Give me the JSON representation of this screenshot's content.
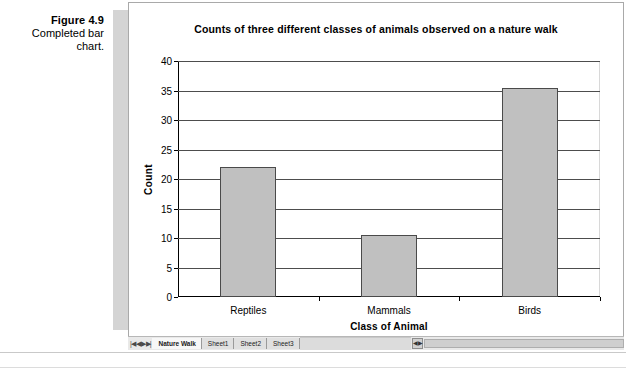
{
  "figure": {
    "number": "Figure 4.9",
    "description": "Completed bar chart."
  },
  "chart_data": {
    "type": "bar",
    "title": "Counts of three different classes of animals observed on a nature walk",
    "xlabel": "Class of Animal",
    "ylabel": "Count",
    "categories": [
      "Reptiles",
      "Mammals",
      "Birds"
    ],
    "values": [
      22,
      10.5,
      35.5
    ],
    "ylim": [
      0,
      40
    ],
    "ytick_labels": [
      "40",
      "35",
      "30",
      "25",
      "20",
      "15",
      "10",
      "5",
      "0"
    ],
    "ytick_values": [
      40,
      35,
      30,
      25,
      20,
      15,
      10,
      5,
      0
    ],
    "ytick_step": 5,
    "grid": true,
    "legend": false,
    "bar_fill_color": "#c0c0c0",
    "bar_border_color": "#4a4a4a",
    "plot_background": "#ffffff"
  },
  "workbook": {
    "scroll_arrows": "|◀ ◀ ▶ ▶|",
    "tabs": [
      {
        "label": "Nature Walk",
        "active": true
      },
      {
        "label": "Sheet1",
        "active": false
      },
      {
        "label": "Sheet2",
        "active": false
      },
      {
        "label": "Sheet3",
        "active": false
      }
    ],
    "splitter_glyph": "◀▶"
  }
}
